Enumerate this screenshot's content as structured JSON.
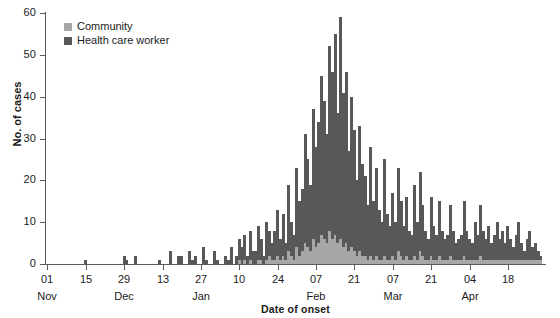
{
  "chart_data": {
    "type": "bar",
    "stacked": true,
    "title": "",
    "subtitle": "",
    "xlabel": "Date of onset",
    "ylabel": "No. of cases",
    "ylim": [
      0,
      60
    ],
    "yticks": [
      0,
      10,
      20,
      30,
      40,
      50,
      60
    ],
    "grid": false,
    "legend_position": "top-left",
    "legend": [
      "Community",
      "Health care worker"
    ],
    "colors": {
      "community": "#a7a7a9",
      "health_care_worker": "#58585a",
      "axis": "#5a5a5a",
      "text": "#1a1a1a",
      "background": "#ffffff"
    },
    "x_tick_labels": [
      "01",
      "15",
      "29",
      "13",
      "27",
      "10",
      "24",
      "07",
      "21",
      "07",
      "21",
      "04",
      "18"
    ],
    "x_month_labels": [
      {
        "label": "Nov",
        "tick_index": 0
      },
      {
        "label": "Dec",
        "tick_index": 2
      },
      {
        "label": "Jan",
        "tick_index": 4
      },
      {
        "label": "Feb",
        "tick_index": 7
      },
      {
        "label": "Mar",
        "tick_index": 9
      },
      {
        "label": "Apr",
        "tick_index": 11
      }
    ],
    "x_axis_start_date": "Nov 01",
    "x_axis_end_date": "Apr 28",
    "n_days": 179,
    "series": [
      {
        "name": "Community",
        "color": "#a7a7a9",
        "values": [
          0,
          0,
          0,
          0,
          0,
          0,
          0,
          0,
          0,
          0,
          0,
          0,
          0,
          0,
          0,
          0,
          0,
          0,
          0,
          0,
          0,
          0,
          0,
          0,
          0,
          0,
          0,
          0,
          0,
          0,
          0,
          0,
          0,
          0,
          0,
          0,
          0,
          0,
          0,
          0,
          0,
          0,
          0,
          0,
          0,
          0,
          0,
          0,
          0,
          0,
          0,
          0,
          0,
          0,
          0,
          0,
          0,
          0,
          0,
          0,
          0,
          0,
          0,
          0,
          0,
          0,
          0,
          0,
          0,
          0,
          1,
          0,
          1,
          0,
          1,
          0,
          0,
          1,
          1,
          0,
          1,
          2,
          1,
          1,
          2,
          1,
          2,
          1,
          3,
          2,
          1,
          4,
          2,
          3,
          5,
          4,
          3,
          6,
          4,
          5,
          7,
          6,
          5,
          8,
          6,
          7,
          5,
          6,
          4,
          5,
          3,
          4,
          3,
          2,
          3,
          2,
          2,
          1,
          2,
          1,
          2,
          1,
          1,
          2,
          1,
          1,
          2,
          1,
          3,
          2,
          1,
          2,
          1,
          1,
          2,
          1,
          3,
          2,
          1,
          1,
          2,
          1,
          1,
          2,
          1,
          1,
          1,
          2,
          1,
          1,
          1,
          1,
          2,
          1,
          1,
          1,
          1,
          1,
          2,
          1,
          1,
          1,
          1,
          1,
          1,
          1,
          1,
          1,
          1,
          1,
          1,
          1,
          1,
          1,
          1,
          1,
          1,
          1,
          1,
          1,
          1
        ]
      },
      {
        "name": "Health care worker",
        "color": "#58585a",
        "values": [
          0,
          0,
          0,
          0,
          0,
          0,
          0,
          0,
          0,
          0,
          0,
          0,
          0,
          0,
          1,
          0,
          0,
          0,
          0,
          0,
          0,
          0,
          0,
          0,
          0,
          0,
          0,
          0,
          2,
          1,
          0,
          0,
          2,
          0,
          0,
          0,
          0,
          0,
          0,
          0,
          0,
          1,
          0,
          0,
          0,
          3,
          0,
          0,
          2,
          2,
          0,
          0,
          3,
          1,
          2,
          0,
          0,
          4,
          1,
          0,
          0,
          3,
          1,
          0,
          0,
          2,
          1,
          4,
          0,
          2,
          5,
          4,
          6,
          2,
          7,
          3,
          3,
          8,
          5,
          2,
          9,
          6,
          4,
          7,
          11,
          5,
          10,
          4,
          16,
          8,
          6,
          19,
          13,
          15,
          26,
          21,
          16,
          31,
          24,
          29,
          38,
          33,
          26,
          44,
          40,
          48,
          31,
          53,
          37,
          41,
          24,
          36,
          29,
          18,
          30,
          22,
          19,
          13,
          26,
          14,
          21,
          12,
          9,
          23,
          11,
          8,
          15,
          9,
          20,
          13,
          8,
          14,
          7,
          6,
          17,
          9,
          19,
          12,
          7,
          5,
          14,
          8,
          6,
          13,
          7,
          5,
          6,
          12,
          7,
          4,
          5,
          6,
          13,
          7,
          5,
          4,
          9,
          6,
          12,
          7,
          5,
          8,
          4,
          6,
          9,
          5,
          7,
          4,
          8,
          5,
          3,
          6,
          9,
          4,
          2,
          5,
          7,
          3,
          4,
          2,
          1
        ]
      }
    ]
  }
}
